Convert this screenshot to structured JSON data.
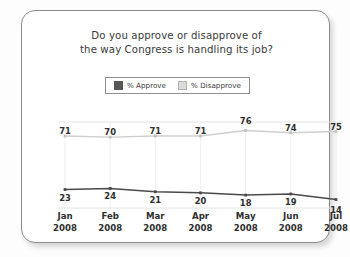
{
  "card": {
    "title_line1": "Do you approve or disapprove of",
    "title_line2": "the way Congress is handling its job?"
  },
  "legend": {
    "items": [
      {
        "label": "% Approve",
        "swatch": "dark-square-swatch",
        "color": "#575757"
      },
      {
        "label": "% Disapprove",
        "swatch": "light-square-swatch",
        "color": "#dadada"
      }
    ]
  },
  "chart_data": {
    "type": "line",
    "title": "Do you approve or disapprove of the way Congress is handling its job?",
    "subtitle": "",
    "xlabel": "",
    "ylabel": "",
    "ylim": [
      0,
      100
    ],
    "grid": "vertical",
    "legend_position": "top-center",
    "categories": [
      "Jan\n2008",
      "Feb\n2008",
      "Mar\n2008",
      "Apr\n2008",
      "May\n2008",
      "Jun\n2008",
      "Jul\n2008"
    ],
    "category_months": [
      "Jan",
      "Feb",
      "Mar",
      "Apr",
      "May",
      "Jun",
      "Jul"
    ],
    "category_years": [
      "2008",
      "2008",
      "2008",
      "2008",
      "2008",
      "2008",
      "2008"
    ],
    "series": [
      {
        "name": "% Approve",
        "color": "#4a4a4a",
        "values": [
          23,
          24,
          21,
          20,
          18,
          19,
          14
        ]
      },
      {
        "name": "% Disapprove",
        "color": "#cfcfcf",
        "values": [
          71,
          70,
          71,
          71,
          76,
          74,
          75
        ]
      }
    ]
  }
}
